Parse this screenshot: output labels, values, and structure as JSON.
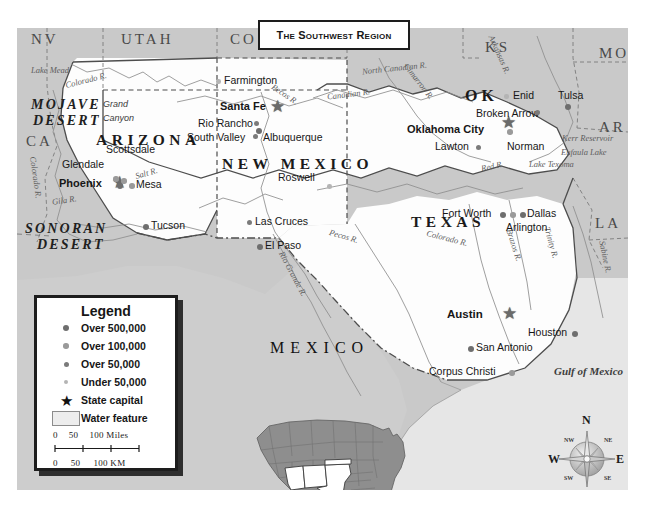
{
  "title": {
    "text": "The Southwest Region"
  },
  "legend": {
    "heading": "Legend",
    "entries": [
      {
        "key": "dot-large",
        "label": "Over 500,000"
      },
      {
        "key": "dot-medium",
        "label": "Over 100,000"
      },
      {
        "key": "dot-small",
        "label": "Over 50,000"
      },
      {
        "key": "dot-tiny",
        "label": "Under 50,000"
      },
      {
        "key": "star-icon",
        "label": "State capital"
      },
      {
        "key": "water-swatch",
        "label": "Water feature"
      }
    ],
    "scale": {
      "miles_labels": [
        "0",
        "50",
        "100 Miles"
      ],
      "km_labels": [
        "0",
        "50",
        "100 KM"
      ]
    }
  },
  "compass": {
    "n": "N",
    "ne": "NE",
    "e": "E",
    "se": "SE",
    "s": "S",
    "sw": "SW",
    "w": "W",
    "nw": "NW"
  },
  "states_featured": [
    {
      "name": "ARIZONA"
    },
    {
      "name": "NEW  MEXICO"
    },
    {
      "name": "TEXAS"
    },
    {
      "name": "OK"
    }
  ],
  "states_neighbors": [
    {
      "abbr": "NV"
    },
    {
      "abbr": "UTAH"
    },
    {
      "abbr": "CO"
    },
    {
      "abbr": "KS"
    },
    {
      "abbr": "MO"
    },
    {
      "abbr": "AR"
    },
    {
      "abbr": "LA"
    },
    {
      "abbr": "CA"
    }
  ],
  "country": {
    "mexico": "MEXICO"
  },
  "physical": [
    {
      "name": "MOJAVE"
    },
    {
      "name": "DESERT"
    },
    {
      "name": "SONORAN"
    },
    {
      "name": "DESERT"
    },
    {
      "name": "Grand"
    },
    {
      "name": "Canyon"
    }
  ],
  "water_features": [
    {
      "name": "Lake Mead"
    },
    {
      "name": "Colorado R."
    },
    {
      "name": "Colorado R."
    },
    {
      "name": "Gila R."
    },
    {
      "name": "Salt R."
    },
    {
      "name": "Pecos R."
    },
    {
      "name": "Pecos R."
    },
    {
      "name": "Rio Grande R."
    },
    {
      "name": "Canadian R."
    },
    {
      "name": "North Canadian R."
    },
    {
      "name": "Cimarron R."
    },
    {
      "name": "Arkansas R."
    },
    {
      "name": "Red R."
    },
    {
      "name": "Colorado R."
    },
    {
      "name": "Brazos R."
    },
    {
      "name": "Trinity R."
    },
    {
      "name": "Sabine R."
    },
    {
      "name": "Kerr Reservoir"
    },
    {
      "name": "Eufaula Lake"
    },
    {
      "name": "Lake Texoma"
    },
    {
      "name": "Gulf of Mexico"
    }
  ],
  "cities": [
    {
      "name": "Phoenix",
      "class": "capital"
    },
    {
      "name": "Glendale",
      "class": "over-100k"
    },
    {
      "name": "Scottsdale",
      "class": "over-100k"
    },
    {
      "name": "Mesa",
      "class": "over-100k"
    },
    {
      "name": "Tucson",
      "class": "over-500k"
    },
    {
      "name": "Santa Fe",
      "class": "capital"
    },
    {
      "name": "Rio Rancho",
      "class": "over-50k"
    },
    {
      "name": "South Valley",
      "class": "over-50k"
    },
    {
      "name": "Albuquerque",
      "class": "over-500k"
    },
    {
      "name": "Farmington",
      "class": "under-50k"
    },
    {
      "name": "Roswell",
      "class": "under-50k"
    },
    {
      "name": "Las Cruces",
      "class": "over-50k"
    },
    {
      "name": "El Paso",
      "class": "over-500k"
    },
    {
      "name": "Oklahoma City",
      "class": "capital"
    },
    {
      "name": "Broken Arrow",
      "class": "over-50k"
    },
    {
      "name": "Enid",
      "class": "under-50k"
    },
    {
      "name": "Tulsa",
      "class": "over-500k"
    },
    {
      "name": "Lawton",
      "class": "over-50k"
    },
    {
      "name": "Norman",
      "class": "over-100k"
    },
    {
      "name": "Fort Worth",
      "class": "over-500k"
    },
    {
      "name": "Dallas",
      "class": "over-500k"
    },
    {
      "name": "Arlington",
      "class": "over-100k"
    },
    {
      "name": "Austin",
      "class": "capital"
    },
    {
      "name": "Houston",
      "class": "over-500k"
    },
    {
      "name": "San Antonio",
      "class": "over-500k"
    },
    {
      "name": "Corpus Christi",
      "class": "over-100k"
    }
  ]
}
